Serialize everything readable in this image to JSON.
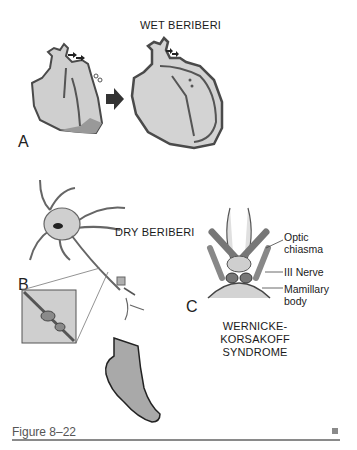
{
  "figure": {
    "caption": "Figure 8–22",
    "end_marker": "■"
  },
  "panels": {
    "A": {
      "letter": "A",
      "title": "WET BERIBERI",
      "description": "Normal heart to dilated heart transition"
    },
    "B": {
      "letter": "B",
      "title": "DRY BERIBERI",
      "description": "Neuron with axon degeneration inset and foot"
    },
    "C": {
      "letter": "C",
      "title_line1": "WERNICKE-KORSAKOFF",
      "title_line2": "SYNDROME",
      "labels": {
        "optic_line1": "Optic",
        "optic_line2": "chiasma",
        "nerve": "III Nerve",
        "mamillary_line1": "Mamillary",
        "mamillary_line2": "body"
      }
    }
  },
  "colors": {
    "fill_light": "#d3d3d3",
    "fill_mid": "#a9a9a9",
    "outline": "#4a4a4a",
    "dark": "#2b2b2b",
    "rule": "#8a8a8a"
  }
}
